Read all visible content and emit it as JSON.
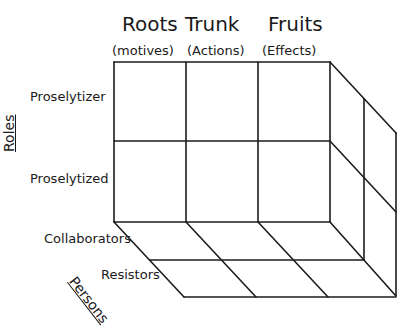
{
  "columns": [
    {
      "title": "Roots",
      "subtitle": "(motives)"
    },
    {
      "title": "Trunk",
      "subtitle": "(Actions)"
    },
    {
      "title": "Fruits",
      "subtitle": "(Effects)"
    }
  ],
  "rows_axis": {
    "label": "Roles",
    "items": [
      "Proselytizer",
      "Proselytized"
    ]
  },
  "depth_axis": {
    "label": "Persons",
    "items": [
      "Collaborators",
      "Resistors"
    ]
  },
  "colors": {
    "line": "#1c1c1c",
    "background": "#ffffff"
  }
}
